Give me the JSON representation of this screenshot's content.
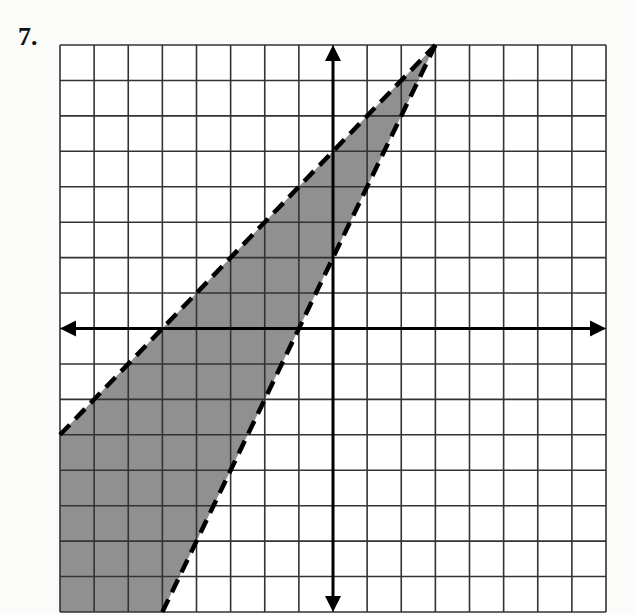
{
  "problem": {
    "number_label": "7."
  },
  "chart_data": {
    "type": "inequality-graph",
    "title": "",
    "xlabel": "",
    "ylabel": "",
    "xlim": [
      -8,
      8
    ],
    "ylim": [
      -8,
      8
    ],
    "grid": true,
    "grid_step": 1,
    "axes_arrows": true,
    "boundary_lines": [
      {
        "equation": "y = x + 5",
        "style": "dashed",
        "points": [
          [
            -8,
            -3
          ],
          [
            3,
            8
          ]
        ]
      },
      {
        "equation": "y = 2x + 2",
        "style": "dashed",
        "points": [
          [
            -5,
            -8
          ],
          [
            3,
            8
          ]
        ]
      }
    ],
    "shaded_region": {
      "description": "y < x + 5 and y > 2x + 2",
      "polygon": [
        [
          3,
          8
        ],
        [
          -8,
          -3
        ],
        [
          -8,
          -8
        ],
        [
          -5,
          -8
        ]
      ],
      "color": "#8a8a8a"
    },
    "colors": {
      "grid": "#333333",
      "axis": "#000000",
      "shade": "#8a8a8a",
      "line": "#000000"
    }
  }
}
